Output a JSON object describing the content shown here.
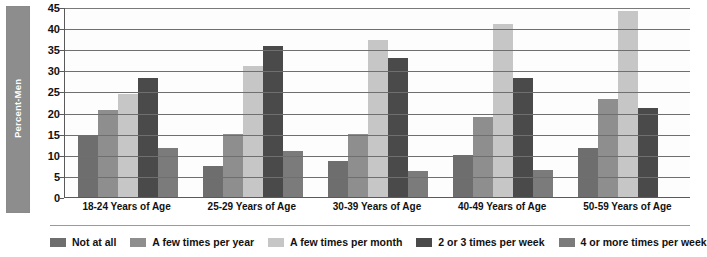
{
  "chart_data": {
    "type": "bar",
    "title": "",
    "xlabel": "",
    "ylabel": "Percent-Men",
    "ylim": [
      0,
      45
    ],
    "ytick_step": 5,
    "yticks": [
      "0",
      "5",
      "10",
      "15",
      "20",
      "25",
      "30",
      "35",
      "40",
      "45"
    ],
    "grid": true,
    "legend_position": "bottom",
    "categories": [
      "18-24 Years of Age",
      "25-29 Years of Age",
      "30-39 Years of Age",
      "40-49 Years of Age",
      "50-59 Years of Age"
    ],
    "series": [
      {
        "name": "Not at all",
        "color": "#6e6e6e",
        "values": [
          14.8,
          7.3,
          8.5,
          10.0,
          11.5
        ]
      },
      {
        "name": "A few times per year",
        "color": "#8e8e8e",
        "values": [
          20.5,
          15.0,
          15.0,
          19.0,
          23.3
        ]
      },
      {
        "name": "A few times per month",
        "color": "#c6c6c6",
        "values": [
          24.3,
          31.0,
          37.3,
          41.0,
          44.0
        ]
      },
      {
        "name": "2 or 3 times per week",
        "color": "#4a4a4a",
        "values": [
          28.3,
          35.7,
          33.0,
          28.3,
          21.0
        ]
      },
      {
        "name": "4 or more times per week",
        "color": "#7b7b7b",
        "values": [
          11.5,
          10.8,
          6.2,
          6.3,
          0.0
        ]
      }
    ]
  },
  "axis": {
    "y_title": "Percent-Men"
  },
  "legend": {
    "items": [
      "Not at all",
      "A few times per year",
      "A few times per month",
      "2 or 3 times per week",
      "4 or more times per week"
    ]
  }
}
